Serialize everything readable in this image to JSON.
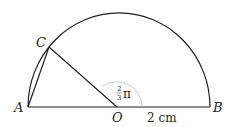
{
  "labels": {
    "A": "A",
    "B": "B",
    "C": "C",
    "O": "O",
    "radius": "2 cm",
    "angle_num": "2",
    "angle_den": "3",
    "angle_pi": "π"
  },
  "colors": {
    "stroke": "#231f20",
    "angle_arc": "#bcbcbc"
  }
}
